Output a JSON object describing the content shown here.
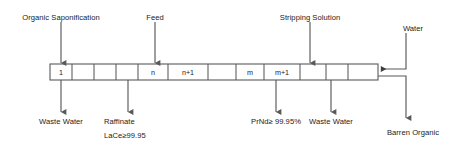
{
  "diagram": {
    "type": "process-flow-diagram",
    "colors": {
      "line": "#595959",
      "text": "#1a1a1a",
      "background": "#ffffff"
    },
    "cascade": {
      "name": "extraction-stage-cascade",
      "stage_count": 14,
      "cells": [
        {
          "label": "1",
          "index": 0
        },
        {
          "label": "",
          "index": 1
        },
        {
          "label": "",
          "index": 2
        },
        {
          "label": "",
          "index": 3
        },
        {
          "label": "n",
          "index": 4
        },
        {
          "label": "n+1",
          "index": 5
        },
        {
          "label": "",
          "index": 6
        },
        {
          "label": "m",
          "index": 7
        },
        {
          "label": "m+1",
          "index": 8
        },
        {
          "label": "",
          "index": 9
        },
        {
          "label": "",
          "index": 10
        },
        {
          "label": "",
          "index": 11
        }
      ]
    },
    "inlets": [
      {
        "name": "organic-saponification",
        "label": "Organic Saponification"
      },
      {
        "name": "feed",
        "label": "Feed"
      },
      {
        "name": "stripping-solution",
        "label": "Stripping Solution"
      },
      {
        "name": "water",
        "label": "Water"
      }
    ],
    "outlets": [
      {
        "name": "waste-water-left",
        "label": "Waste Water"
      },
      {
        "name": "raffinate",
        "label": "Raffinate",
        "sub_label": "LaCe≥99.95"
      },
      {
        "name": "prnd-product",
        "label": "PrNd≥ 99.95%"
      },
      {
        "name": "waste-water-right",
        "label": "Waste Water"
      },
      {
        "name": "barren-organic",
        "label": "Barren Organic"
      }
    ]
  }
}
